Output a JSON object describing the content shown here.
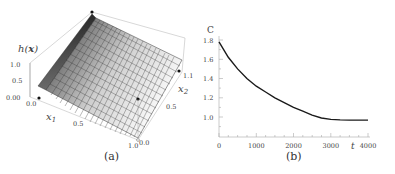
{
  "chart_data": [
    {
      "type": "surface3d",
      "panel": "(a)",
      "zlabel": "h(x)",
      "xlabel": "x1",
      "ylabel": "x2",
      "x_ticks": [
        "0.0",
        "0.5",
        "1.0"
      ],
      "y_ticks": [
        "0.0",
        "0.5",
        "1.1"
      ],
      "z_ticks": [
        "0.00",
        "0.5",
        "1.0"
      ],
      "xlim": [
        0,
        1.0
      ],
      "ylim": [
        0,
        1.1
      ],
      "zlim": [
        0,
        1.0
      ],
      "description": "Surface h(x) rising steeply from 0 near x1=0 to a peak ridge ~1.0, then decreasing linearly toward 0 as x1 increases to 1.0; meshed grid, grayscale shading",
      "marked_points": 4
    },
    {
      "type": "line",
      "panel": "(b)",
      "title": "",
      "ylabel": "C",
      "xlabel": "t",
      "x_ticks": [
        "0",
        "1000",
        "2000",
        "3000",
        "4000"
      ],
      "y_ticks": [
        "1.0",
        "1.2",
        "1.4",
        "1.6",
        "1.8"
      ],
      "xlim": [
        0,
        4000
      ],
      "ylim": [
        0.82,
        1.82
      ],
      "grid": false,
      "series": [
        {
          "name": "C(t)",
          "x": [
            0,
            250,
            500,
            750,
            1000,
            1250,
            1500,
            1750,
            2000,
            2250,
            2500,
            2750,
            3000,
            3250,
            3500,
            3750,
            4000
          ],
          "values": [
            1.78,
            1.62,
            1.5,
            1.4,
            1.32,
            1.26,
            1.2,
            1.15,
            1.1,
            1.06,
            1.02,
            0.99,
            0.975,
            0.97,
            0.968,
            0.968,
            0.968
          ]
        }
      ]
    }
  ],
  "panel_a": {
    "caption": "(a)",
    "zlabel": "h(x)",
    "x1_label": "x",
    "x1_sub": "1",
    "x2_label": "x",
    "x2_sub": "2",
    "z_ticks": [
      "1.0",
      "0.5",
      "0.00"
    ],
    "x1_ticks": [
      "0.0",
      "0.5",
      "1.0"
    ],
    "x2_ticks": [
      "0.0",
      "0.5",
      "1.1"
    ]
  },
  "panel_b": {
    "caption": "(b)",
    "ylabel": "C",
    "xlabel": "t",
    "y_ticks": [
      "1.8",
      "1.6",
      "1.4",
      "1.2",
      "1.0"
    ],
    "x_ticks": [
      "0",
      "1000",
      "2000",
      "3000",
      "4000"
    ]
  }
}
